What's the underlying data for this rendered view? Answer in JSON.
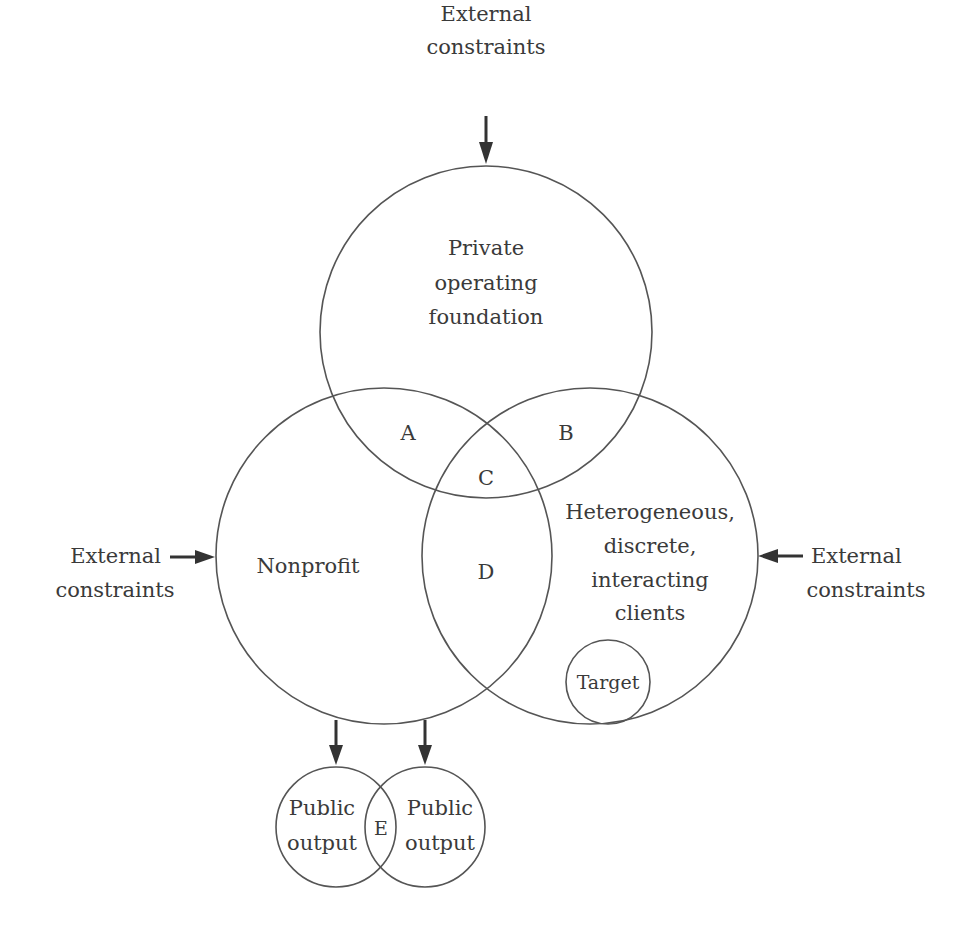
{
  "diagram": {
    "type": "venn",
    "colors": {
      "stroke": "#555555",
      "text": "#3a3a3a",
      "arrow": "#333333",
      "background": "#ffffff"
    },
    "external_top": {
      "line1": "External",
      "line2": "constraints"
    },
    "external_left": {
      "line1": "External",
      "line2": "constraints"
    },
    "external_right": {
      "line1": "External",
      "line2": "constraints"
    },
    "circles": {
      "private_foundation": {
        "line1": "Private",
        "line2": "operating",
        "line3": "foundation"
      },
      "nonprofit": {
        "label": "Nonprofit"
      },
      "clients": {
        "line1": "Heterogeneous,",
        "line2": "discrete,",
        "line3": "interacting",
        "line4": "clients"
      },
      "target": {
        "label": "Target"
      },
      "public_output_left": {
        "line1": "Public",
        "line2": "output"
      },
      "public_output_right": {
        "line1": "Public",
        "line2": "output"
      }
    },
    "regions": {
      "a": "A",
      "b": "B",
      "c": "C",
      "d": "D",
      "e": "E"
    }
  }
}
